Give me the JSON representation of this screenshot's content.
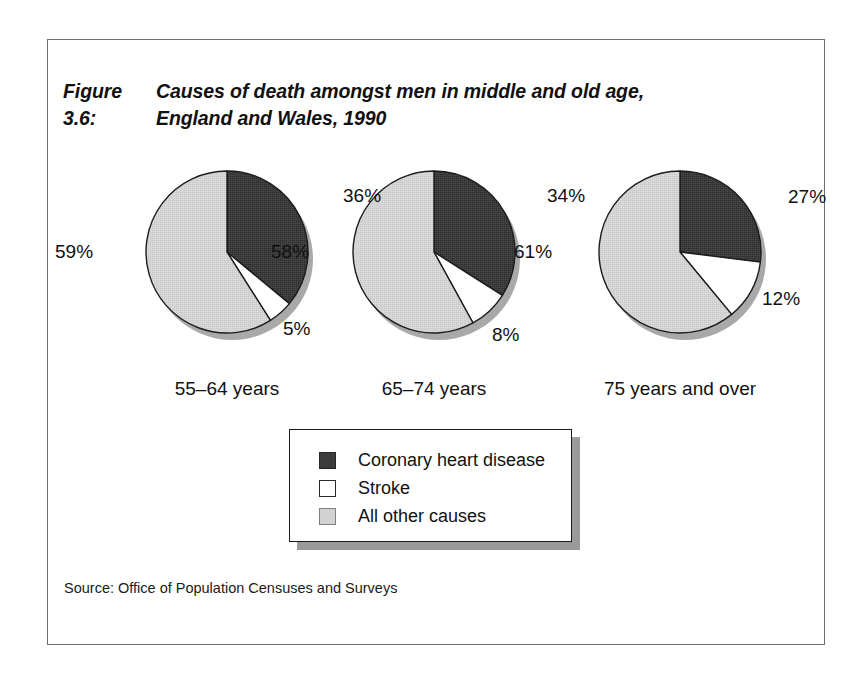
{
  "figure": {
    "number_label": "Figure 3.6:",
    "title_line1": "Causes of death amongst men in middle and old age,",
    "title_line2": "England and Wales, 1990",
    "source": "Source: Office of Population Censuses and Surveys"
  },
  "legend": {
    "items": [
      {
        "label": "Coronary heart disease",
        "color": "#3b3b3b",
        "swatch": "dark-filled-square"
      },
      {
        "label": "Stroke",
        "color": "#ffffff",
        "swatch": "white-outlined-square"
      },
      {
        "label": "All other causes",
        "color": "#d2d2d2",
        "swatch": "lightgray-outlined-square"
      }
    ]
  },
  "colors": {
    "coronary_heart_disease": "#3b3b3b",
    "stroke": "#ffffff",
    "all_other_causes": "#d2d2d2",
    "slice_outline": "#1c1c1c",
    "pie_shadow": "#9a9a9a",
    "frame": "#6f6f6f"
  },
  "chart_data": {
    "type": "pie",
    "subtitle": "",
    "xlabel": "",
    "ylabel": "",
    "grid": false,
    "legend_position": "bottom-center",
    "value_suffix": "%",
    "categories": [
      "Coronary heart disease",
      "Stroke",
      "All other causes"
    ],
    "panels": [
      {
        "name": "55-64 years",
        "label": "55–64 years",
        "values": [
          36,
          5,
          59
        ],
        "labels": [
          "36%",
          "5%",
          "59%"
        ],
        "center": {
          "x": 227,
          "y": 252
        },
        "radius": 81
      },
      {
        "name": "65-74 years",
        "label": "65–74 years",
        "values": [
          34,
          8,
          58
        ],
        "labels": [
          "34%",
          "8%",
          "58%"
        ],
        "center": {
          "x": 434,
          "y": 252
        },
        "radius": 81
      },
      {
        "name": "75 years and over",
        "label": "75 years and over",
        "values": [
          27,
          12,
          61
        ],
        "labels": [
          "27%",
          "12%",
          "61%"
        ],
        "center": {
          "x": 680,
          "y": 252
        },
        "radius": 81
      }
    ],
    "annotations": [
      {
        "text": "36%",
        "panel": 0,
        "slice": "Coronary heart disease"
      },
      {
        "text": "5%",
        "panel": 0,
        "slice": "Stroke"
      },
      {
        "text": "59%",
        "panel": 0,
        "slice": "All other causes"
      },
      {
        "text": "34%",
        "panel": 1,
        "slice": "Coronary heart disease"
      },
      {
        "text": "8%",
        "panel": 1,
        "slice": "Stroke"
      },
      {
        "text": "58%",
        "panel": 1,
        "slice": "All other causes"
      },
      {
        "text": "27%",
        "panel": 2,
        "slice": "Coronary heart disease"
      },
      {
        "text": "12%",
        "panel": 2,
        "slice": "Stroke"
      },
      {
        "text": "61%",
        "panel": 2,
        "slice": "All other causes"
      }
    ]
  },
  "pct_labels": [
    {
      "text": "36%",
      "left": 343,
      "top": 185
    },
    {
      "text": "5%",
      "left": 283,
      "top": 318
    },
    {
      "text": "59%",
      "left": 55,
      "top": 241
    },
    {
      "text": "34%",
      "left": 547,
      "top": 185
    },
    {
      "text": "8%",
      "left": 492,
      "top": 324
    },
    {
      "text": "58%",
      "left": 271,
      "top": 241
    },
    {
      "text": "27%",
      "left": 788,
      "top": 186
    },
    {
      "text": "12%",
      "left": 762,
      "top": 288
    },
    {
      "text": "61%",
      "left": 514,
      "top": 241
    }
  ],
  "cat_labels": [
    {
      "text": "55–64 years",
      "left": 227,
      "top": 378
    },
    {
      "text": "65–74 years",
      "left": 434,
      "top": 378
    },
    {
      "text": "75 years and over",
      "left": 680,
      "top": 378
    }
  ]
}
